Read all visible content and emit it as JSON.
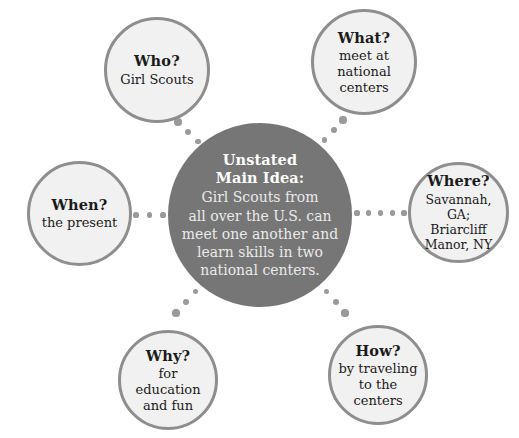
{
  "diagram": {
    "type": "unstated-main-idea-web",
    "center": {
      "heading_line1": "Unstated",
      "heading_line2": "Main Idea:",
      "body": "Girl Scouts from\nall over the U.S. can\nmeet one another and\nlearn skills in two\nnational centers.",
      "fill_color": "#767676",
      "text_color": "#ffffff"
    },
    "bubbles": [
      {
        "id": "who",
        "question": "Who?",
        "answer": "Girl Scouts",
        "position": "top-left"
      },
      {
        "id": "what",
        "question": "What?",
        "answer": "meet at\nnational\ncenters",
        "position": "top-right"
      },
      {
        "id": "where",
        "question": "Where?",
        "answer": "Savannah, GA;\nBriarcliff\nManor, NY",
        "position": "right"
      },
      {
        "id": "how",
        "question": "How?",
        "answer": "by traveling\nto the\ncenters",
        "position": "bottom-right"
      },
      {
        "id": "why",
        "question": "Why?",
        "answer": "for education\nand fun",
        "position": "bottom-left"
      },
      {
        "id": "when",
        "question": "When?",
        "answer": "the present",
        "position": "left"
      }
    ],
    "style": {
      "bubble_fill": "#f1f1f1",
      "bubble_border": "#8e8e8e",
      "connector_dot_color": "#9a9a9a",
      "background": "#ffffff"
    }
  }
}
